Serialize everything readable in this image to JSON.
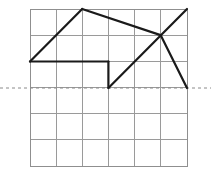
{
  "figure": {
    "title": "",
    "type": "grid-polyline-diagram",
    "canvas": {
      "width": 211,
      "height": 171
    },
    "colors": {
      "background": "#ffffff",
      "grid_line": "#9a9a9a",
      "grid_border": "#8f8f8f",
      "polyline": "#1a1a1a",
      "dashed_reference": "#8a8a8a"
    },
    "grid": {
      "columns": 6,
      "rows": 6,
      "cell_width": 26.1,
      "cell_height": 26.1,
      "x_left": 30,
      "x_right": 187,
      "y_top": 9,
      "y_bottom": 166,
      "x_positions": [
        30,
        56.1,
        82.2,
        108.4,
        134.5,
        160.6,
        187
      ],
      "y_positions": [
        9,
        35.1,
        61.2,
        87.4,
        113.5,
        139.6,
        166
      ],
      "stroke_width": 1,
      "visible": true
    },
    "dashed_line": {
      "label": "reference-axis",
      "y": 88,
      "x_start": 0,
      "x_end": 211,
      "dash_pattern": "3 3",
      "stroke_width": 1
    },
    "polyline": {
      "label": "zigzag-path",
      "stroke_width": 2.2,
      "closed": false,
      "segments": [
        {
          "name": "ascending-left",
          "points": [
            [
              30,
              61.5
            ],
            [
              82.2,
              9
            ]
          ]
        },
        {
          "name": "base-horizontal",
          "points": [
            [
              30,
              61.5
            ],
            [
              108.4,
              61.5
            ]
          ]
        },
        {
          "name": "descending-from-peak",
          "points": [
            [
              82.2,
              9
            ],
            [
              160.6,
              35.1
            ]
          ]
        },
        {
          "name": "valley-down",
          "points": [
            [
              108.4,
              61.5
            ],
            [
              108.4,
              88
            ]
          ]
        },
        {
          "name": "valley-up",
          "points": [
            [
              108.4,
              88
            ],
            [
              187,
              9
            ]
          ]
        },
        {
          "name": "descending-right",
          "points": [
            [
              160.6,
              35.1
            ],
            [
              187,
              88
            ]
          ]
        }
      ],
      "vertices": [
        {
          "name": "left-base",
          "x": 30,
          "y": 61.5
        },
        {
          "name": "peak-top",
          "x": 82.2,
          "y": 9
        },
        {
          "name": "base-right",
          "x": 108.4,
          "y": 61.5
        },
        {
          "name": "valley-bottom",
          "x": 108.4,
          "y": 88
        },
        {
          "name": "mid-right",
          "x": 160.6,
          "y": 35.1
        },
        {
          "name": "top-right",
          "x": 187,
          "y": 9
        },
        {
          "name": "bottom-right",
          "x": 187,
          "y": 88
        }
      ],
      "crossing_point": {
        "name": "x-crossing",
        "x": 160.6,
        "y": 48
      }
    }
  }
}
